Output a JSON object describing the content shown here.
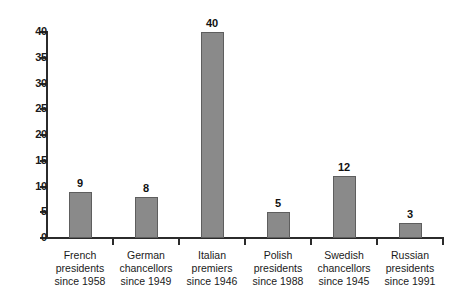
{
  "chart_data": {
    "type": "bar",
    "title": "",
    "subtitle": "",
    "xlabel": "",
    "ylabel": "",
    "ylim": [
      0,
      40
    ],
    "yticks": [
      0,
      5,
      10,
      15,
      20,
      25,
      30,
      35,
      40
    ],
    "grid": false,
    "legend": null,
    "categories": [
      "French presidents since 1958",
      "German chancellors since 1949",
      "Italian premiers since 1946",
      "Polish presidents since 1988",
      "Swedish chancellors since 1945",
      "Russian presidents since 1991"
    ],
    "category_lines": [
      [
        "French",
        "presidents",
        "since 1958"
      ],
      [
        "German",
        "chancellors",
        "since 1949"
      ],
      [
        "Italian",
        "premiers",
        "since 1946"
      ],
      [
        "Polish",
        "presidents",
        "since 1988"
      ],
      [
        "Swedish",
        "chancellors",
        "since 1945"
      ],
      [
        "Russian",
        "presidents",
        "since 1991"
      ]
    ],
    "values": [
      9,
      8,
      40,
      5,
      12,
      3
    ],
    "value_labels": [
      "9",
      "8",
      "40",
      "5",
      "12",
      "3"
    ],
    "colors": {
      "bar_fill": "#8a8a8a",
      "bar_stroke": "#5e5e5e",
      "axis": "#2b2b2b",
      "text": "#1a1a1a",
      "background": "#ffffff"
    }
  },
  "axis": {
    "y_tick_labels": [
      "0",
      "5",
      "10",
      "15",
      "20",
      "25",
      "30",
      "35",
      "40"
    ]
  }
}
